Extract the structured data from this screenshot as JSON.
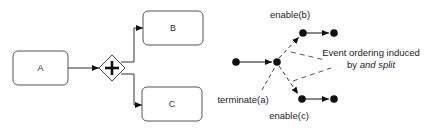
{
  "bpmn_diagram": {
    "tasks": [
      {
        "id": "A",
        "label": "A"
      },
      {
        "id": "B",
        "label": "B"
      },
      {
        "id": "C",
        "label": "C"
      }
    ],
    "gateway": {
      "type": "parallel",
      "symbol": "+"
    },
    "flows": [
      {
        "from": "A",
        "to": "gateway"
      },
      {
        "from": "gateway",
        "to": "B"
      },
      {
        "from": "gateway",
        "to": "C"
      }
    ]
  },
  "event_graph": {
    "labels": {
      "enable_b": "enable(b)",
      "enable_c": "enable(c)",
      "terminate_a": "terminate(a)",
      "annotation_line1": "Event ordering induced",
      "annotation_line2_prefix": "by ",
      "annotation_line2_italic": "and split"
    }
  },
  "colors": {
    "stroke": "#333333",
    "node": "#111111",
    "text": "#222222",
    "dash": "#444444"
  }
}
